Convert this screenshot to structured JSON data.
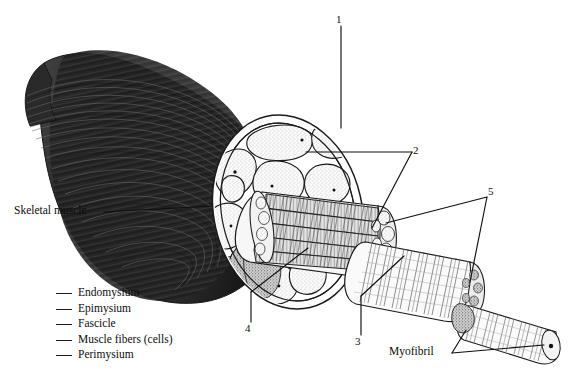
{
  "figure": {
    "title_visible": false,
    "ink_color": "#1a1a1a",
    "paper_color": "#ffffff",
    "belly_dark": "#2b2b2b"
  },
  "callouts": [
    {
      "id": "1",
      "label": "1",
      "x": 338,
      "y": 14
    },
    {
      "id": "2",
      "label": "2",
      "x": 414,
      "y": 145
    },
    {
      "id": "5",
      "label": "5",
      "x": 489,
      "y": 186
    },
    {
      "id": "4",
      "label": "4",
      "x": 244,
      "y": 323
    },
    {
      "id": "3",
      "label": "3",
      "x": 354,
      "y": 336
    }
  ],
  "text_labels": [
    {
      "id": "skeletal-muscle",
      "label": "Skeletal muscle",
      "x": 14,
      "y": 205
    },
    {
      "id": "myofibril",
      "label": "Myofibril",
      "x": 389,
      "y": 346
    }
  ],
  "legend": {
    "items": [
      {
        "label": "Endomysium",
        "blank": "___"
      },
      {
        "label": "Epimysium",
        "blank": "___"
      },
      {
        "label": "Fascicle",
        "blank": "___"
      },
      {
        "label": "Muscle fibers (cells)",
        "blank": "___"
      },
      {
        "label": "Perimysium",
        "blank": "___"
      }
    ]
  },
  "structures": [
    {
      "name": "muscle-belly",
      "description": "tapering striated skeletal muscle belly, left side"
    },
    {
      "name": "cross-section-face",
      "description": "oval cut face showing fascicles in connective tissue"
    },
    {
      "name": "fascicle-bundle",
      "description": "bundle of muscle fibers emerging from cut face"
    },
    {
      "name": "muscle-fiber",
      "description": "single striated muscle fiber, lower right"
    },
    {
      "name": "myofibril-strand",
      "description": "thin striated myofibril at far right with end cap"
    }
  ]
}
